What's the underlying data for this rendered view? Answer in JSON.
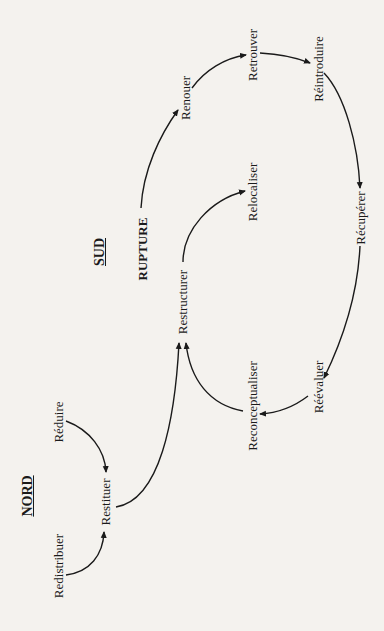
{
  "diagram": {
    "orientation": "rotated-90-ccw",
    "headings": {
      "nord": "NORD",
      "sud": "SUD"
    },
    "rupture": "RUPTURE",
    "nodes": {
      "renouer": "Renouer",
      "retrouver": "Retrouver",
      "reintroduire": "Réintroduire",
      "relocaliser": "Relocaliser",
      "restructurer": "Restructurer",
      "recuperer": "Récupérer",
      "reconceptualiser": "Reconceptualiser",
      "reevaluer": "Réévaluer",
      "reduire": "Réduire",
      "restituer": "Restituer",
      "redistribuer": "Redistribuer"
    },
    "edges": [
      {
        "from": "RUPTURE",
        "to": "Renouer"
      },
      {
        "from": "Renouer",
        "to": "Retrouver"
      },
      {
        "from": "Retrouver",
        "to": "Réintroduire"
      },
      {
        "from": "Réintroduire",
        "to": "Récupérer"
      },
      {
        "from": "Récupérer",
        "to": "Réévaluer"
      },
      {
        "from": "Réévaluer",
        "to": "Reconceptualiser"
      },
      {
        "from": "Reconceptualiser",
        "to": "Restructurer"
      },
      {
        "from": "Restructurer",
        "to": "Relocaliser"
      },
      {
        "from": "Réduire",
        "to": "Restituer"
      },
      {
        "from": "Redistribuer",
        "to": "Restituer"
      },
      {
        "from": "Restituer",
        "to": "Restructurer"
      }
    ],
    "colors": {
      "background": "#f4f2ee",
      "ink": "#1a1a1a"
    }
  }
}
